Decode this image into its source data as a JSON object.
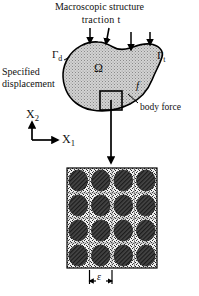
{
  "figure": {
    "kind": "multiscale-mechanics-diagram",
    "title": "Macroscopic structure",
    "background_color": "#ffffff",
    "ink_color": "#000000",
    "domain_fill_color": "#c9c9c9",
    "inclusion_color": "#3a3a3a",
    "matrix_color": "#d9d9d9"
  },
  "labels": {
    "macroscopic_structure": "Macroscopic structure",
    "traction": "traction  t",
    "gamma_d": "Γ",
    "gamma_d_sub": "d",
    "gamma_t": "Γ",
    "gamma_t_sub": "t",
    "specified_displacement": "Specified displacement",
    "omega": "Ω",
    "body_force_symbol": "f",
    "body_force": "body force",
    "axis_x2": "X",
    "axis_x2_sub": "2",
    "axis_x1": "X",
    "axis_x1_sub": "1",
    "epsilon": "ε"
  },
  "macro_domain": {
    "name": "omega-domain-blob",
    "traction_arrow_count": 4,
    "rve_window_label": "unit-cell-window"
  },
  "microstructure": {
    "name": "representative-volume-element",
    "grid_rows": 4,
    "grid_columns": 4,
    "inclusion_shape": "ellipse",
    "inclusion_hatch": "diagonal",
    "size_label": "ε",
    "square_bounds": {
      "x": 67,
      "y": 168,
      "width": 90,
      "height": 100
    }
  }
}
